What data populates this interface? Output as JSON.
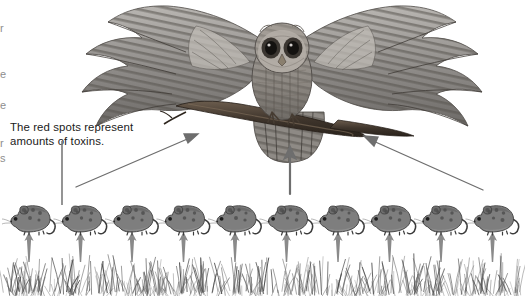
{
  "diagram": {
    "background_color": "#ffffff",
    "annotation": {
      "line1": "The red spots represent",
      "line2": "amounts of toxins.",
      "text_color": "#1a1a1a",
      "leader_line": {
        "x": 62,
        "y_top": 141,
        "y_bottom": 203,
        "color": "#7a7a7a"
      }
    },
    "edge_fragments": [
      {
        "char": "r",
        "top": 22
      },
      {
        "char": "e",
        "top": 68
      },
      {
        "char": "e",
        "top": 99
      },
      {
        "char": "r",
        "top": 137
      },
      {
        "char": "s",
        "top": 152
      }
    ],
    "levels": [
      {
        "name": "producer",
        "label": "grass",
        "count": 1
      },
      {
        "name": "primary-consumer",
        "label": "mouse",
        "count": 10
      },
      {
        "name": "top-predator",
        "label": "owl",
        "count": 1
      }
    ],
    "owl": {
      "name": "owl",
      "center_x": 282,
      "center_y": 62,
      "wing_color": "#8f8f8f",
      "body_color": "#9a9a9a",
      "eye_color": "#2b2b2b",
      "branch_color": "#4a4038"
    },
    "mice": {
      "count": 10,
      "start_x": 12,
      "spacing": 51.5,
      "baseline_y": 224,
      "body_color": "#7e7e7e",
      "outline_color": "#3c3c3c",
      "spot_color": "#b03a3a",
      "spots_per_mouse": 5
    },
    "grass": {
      "top_y": 262,
      "bottom_y": 296,
      "color": "#5a5a5a",
      "blade_count": 300
    },
    "arrows_grass_to_mice": {
      "count": 10,
      "color": "#8a8a8a",
      "tail_y": 262,
      "head_y": 232,
      "style": "vertical"
    },
    "arrows_mice_to_owl": [
      {
        "name": "left-diagonal-arrow",
        "x1": 76,
        "y1": 187,
        "x2": 196,
        "y2": 135,
        "color": "#6e6e6e"
      },
      {
        "name": "center-vertical-arrow",
        "x1": 290,
        "y1": 193,
        "x2": 290,
        "y2": 148,
        "color": "#6e6e6e"
      },
      {
        "name": "right-diagonal-arrow",
        "x1": 483,
        "y1": 190,
        "x2": 365,
        "y2": 137,
        "color": "#6e6e6e"
      }
    ]
  }
}
